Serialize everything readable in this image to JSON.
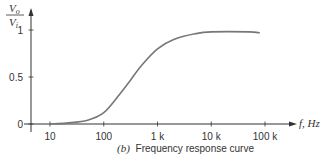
{
  "chart_data": {
    "type": "line",
    "title": "Frequency response curve",
    "caption_prefix": "(b)",
    "xlabel": "f, Hz",
    "ylabel_num": "V",
    "ylabel_num_sub": "o",
    "ylabel_den": "V",
    "ylabel_den_sub": "i",
    "xscale": "log",
    "x_ticks": [
      10,
      100,
      1000,
      10000,
      100000
    ],
    "x_tick_labels": [
      "10",
      "100",
      "1 k",
      "10 k",
      "100 k"
    ],
    "y_ticks": [
      0,
      0.5,
      1
    ],
    "y_tick_labels": [
      "0",
      "0.5",
      "1"
    ],
    "ylim": [
      0,
      1.1
    ],
    "grid": false,
    "series": [
      {
        "name": "Vo/Vi",
        "x": [
          10,
          20,
          50,
          100,
          200,
          300,
          500,
          1000,
          2000,
          5000,
          10000,
          50000,
          80000
        ],
        "values": [
          0.0,
          0.01,
          0.04,
          0.12,
          0.32,
          0.45,
          0.62,
          0.8,
          0.9,
          0.96,
          0.98,
          0.98,
          0.97
        ]
      }
    ]
  }
}
